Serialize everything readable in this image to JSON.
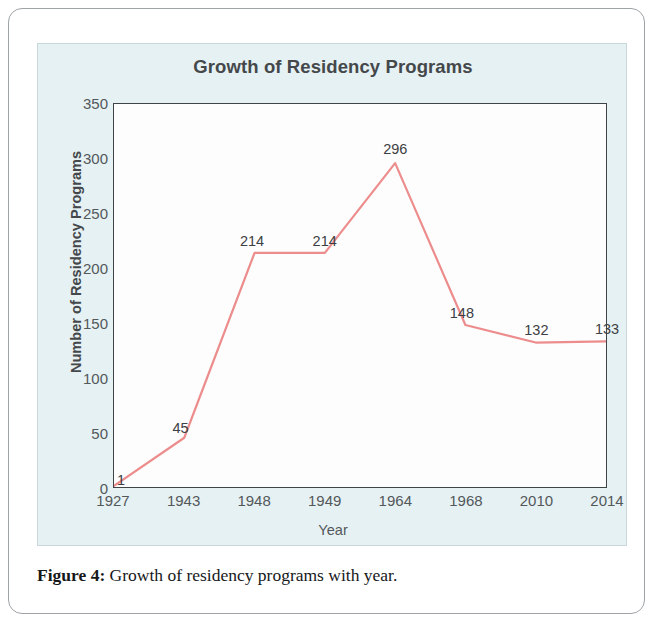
{
  "figure": {
    "caption_label": "Figure 4:",
    "caption_text": "Growth of residency programs with year."
  },
  "chart_data": {
    "type": "line",
    "title": "Growth of Residency Programs",
    "xlabel": "Year",
    "ylabel": "Number of Residency Programs",
    "categories": [
      "1927",
      "1943",
      "1948",
      "1949",
      "1964",
      "1968",
      "2010",
      "2014"
    ],
    "values": [
      1,
      45,
      214,
      214,
      296,
      148,
      132,
      133
    ],
    "point_labels": [
      "1",
      "45",
      "214",
      "214",
      "296",
      "148",
      "132",
      "133"
    ],
    "ylim": [
      0,
      350
    ],
    "ytick_labels": [
      "0",
      "50",
      "100",
      "150",
      "200",
      "250",
      "300",
      "350"
    ],
    "ytick_values": [
      0,
      50,
      100,
      150,
      200,
      250,
      300,
      350
    ],
    "grid": false,
    "legend": false,
    "series": [
      {
        "name": "Number of Residency Programs",
        "values": [
          1,
          45,
          214,
          214,
          296,
          148,
          132,
          133
        ],
        "color": "#ed8c8c"
      }
    ],
    "colors": {
      "line": "#ed8c8c",
      "panel_background": "#e6f1f3",
      "plot_background": "#fdfdfd",
      "axis": "#3f4447",
      "text": "#53585b",
      "title_text": "#44484b"
    }
  }
}
